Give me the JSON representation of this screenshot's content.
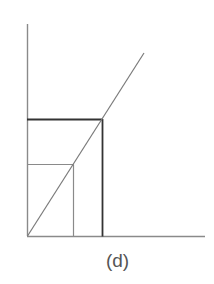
{
  "figure": {
    "label": "(d)",
    "colors": {
      "axis": "#8a8a8a",
      "diagonal": "#7a7a7a",
      "outer_rect": "#333333",
      "inner_rect": "#8a8a8a",
      "label": "#555555"
    }
  },
  "diagram": {
    "type": "geometric-construction",
    "elements": [
      {
        "id": "y-axis",
        "from": [
          27,
          24
        ],
        "to": [
          27,
          236
        ]
      },
      {
        "id": "x-axis",
        "from": [
          27,
          236
        ],
        "to": [
          205,
          236
        ]
      },
      {
        "id": "diagonal-line",
        "from": [
          27,
          236
        ],
        "to": [
          144,
          53
        ]
      },
      {
        "id": "outer-rectangle",
        "x": 27,
        "y": 119,
        "width": 75,
        "height": 117
      },
      {
        "id": "inner-rectangle",
        "x": 27,
        "y": 164,
        "width": 46,
        "height": 72
      }
    ]
  }
}
